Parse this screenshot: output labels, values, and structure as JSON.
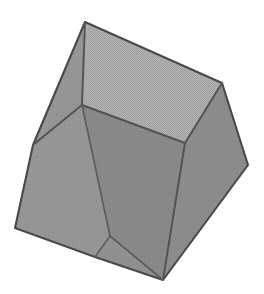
{
  "scene": {
    "title": "Shaded cube",
    "object_name": "cube",
    "background_color": "#ffffff",
    "canvas": {
      "width": 264,
      "height": 294
    },
    "render_style": "dithered halftone grayscale shading with dark outlines",
    "projection": "perspective, tilted / rotated view showing three faces"
  },
  "colors": {
    "background": "#ffffff",
    "top_face": "#b3b3b3",
    "left_face": "#9a9a9a",
    "right_face": "#8e8e8e",
    "front_face": "#8a8a8a",
    "inner_face": "#939393",
    "edge_stroke": "#4a4a4a",
    "edge_stroke_soft": "#5d5d5d",
    "dither_dot": "#6f6f6f"
  },
  "geometry": {
    "vertex_labels": [
      "apex",
      "top-right",
      "right",
      "bottom",
      "bottom-left",
      "left",
      "inner-left",
      "inner-right"
    ],
    "vertices": {
      "apex": {
        "x": 85,
        "y": 22
      },
      "top_right": {
        "x": 222,
        "y": 83
      },
      "right": {
        "x": 248,
        "y": 165
      },
      "bottom": {
        "x": 163,
        "y": 280
      },
      "bottom_left": {
        "x": 95,
        "y": 257
      },
      "far_left": {
        "x": 15,
        "y": 228
      },
      "left": {
        "x": 33,
        "y": 145
      },
      "inner_left": {
        "x": 82,
        "y": 105
      },
      "inner_right": {
        "x": 185,
        "y": 143
      },
      "inner_bottom": {
        "x": 110,
        "y": 236
      }
    },
    "silhouette_points": "85,22 222,83 248,165 163,280 95,257 15,228 33,145",
    "faces": [
      {
        "name": "top-face",
        "points": "85,22 222,83 185,143 82,105",
        "fill_key": "top_face",
        "description": "upper face catching most light"
      },
      {
        "name": "right-face",
        "points": "222,83 248,165 163,280 185,143",
        "fill_key": "right_face",
        "description": "right-hand side face in shadow"
      },
      {
        "name": "front-face",
        "points": "82,105 185,143 163,280 110,236",
        "fill_key": "front_face",
        "description": "large front-facing quad"
      },
      {
        "name": "left-face",
        "points": "85,22 82,105 110,236 95,257 15,228 33,145",
        "fill_key": "left_face",
        "description": "left side band of the cube"
      },
      {
        "name": "bottom-sliver",
        "points": "110,236 163,280 95,257",
        "fill_key": "inner_face",
        "description": "narrow shaded sliver near lower edge"
      }
    ],
    "edges": [
      {
        "name": "edge-apex-topright",
        "from": "apex",
        "to": "top_right",
        "type": "silhouette"
      },
      {
        "name": "edge-topright-right",
        "from": "top_right",
        "to": "right",
        "type": "silhouette"
      },
      {
        "name": "edge-right-bottom",
        "from": "right",
        "to": "bottom",
        "type": "silhouette"
      },
      {
        "name": "edge-bottom-bottomleft",
        "from": "bottom",
        "to": "bottom_left",
        "type": "silhouette"
      },
      {
        "name": "edge-bottomleft-farleft",
        "from": "bottom_left",
        "to": "far_left",
        "type": "silhouette"
      },
      {
        "name": "edge-farleft-left",
        "from": "far_left",
        "to": "left",
        "type": "silhouette"
      },
      {
        "name": "edge-left-apex",
        "from": "left",
        "to": "apex",
        "type": "silhouette"
      },
      {
        "name": "edge-apex-innerleft",
        "from": "apex",
        "to": "inner_left",
        "type": "internal"
      },
      {
        "name": "edge-innerleft-innerright",
        "from": "inner_left",
        "to": "inner_right",
        "type": "internal"
      },
      {
        "name": "edge-innerright-topright",
        "from": "inner_right",
        "to": "top_right",
        "type": "internal"
      },
      {
        "name": "edge-innerright-bottom",
        "from": "inner_right",
        "to": "bottom",
        "type": "internal"
      },
      {
        "name": "edge-innerleft-left",
        "from": "inner_left",
        "to": "left",
        "type": "internal"
      },
      {
        "name": "edge-innerleft-innerbottom",
        "from": "inner_left",
        "to": "inner_bottom",
        "type": "internal"
      },
      {
        "name": "edge-innerbottom-bottom",
        "from": "inner_bottom",
        "to": "bottom",
        "type": "internal"
      },
      {
        "name": "edge-innerbottom-bottomleft",
        "from": "inner_bottom",
        "to": "bottom_left",
        "type": "internal"
      }
    ]
  }
}
